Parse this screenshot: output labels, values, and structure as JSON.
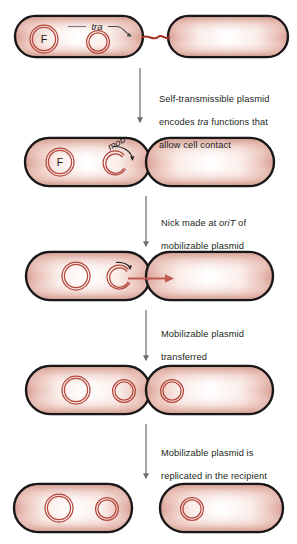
{
  "figure": {
    "colors": {
      "cell_outline": "#1a1618",
      "cell_fill_edge": "#e0a99e",
      "cell_fill_center": "#ffffff",
      "plasmid_stroke": "#b4463c",
      "bridge": "#a83228",
      "transfer_arrow": "#c05a50",
      "connector_arrow": "#6f6f6f",
      "label_leader": "#7a7a7a",
      "caption_text": "#231f20",
      "background": "#ffffff"
    }
  },
  "panels": [
    {
      "id": "panel-1",
      "name": "donor-and-recipient-in-contact",
      "labels": [
        {
          "id": "f-plasmid-label",
          "text": "F"
        },
        {
          "id": "tra-label",
          "text": "tra",
          "italic": true
        }
      ],
      "plasmids": [
        {
          "id": "f-plasmid",
          "label": "F",
          "state": "closed",
          "cell": "donor"
        },
        {
          "id": "mobilizable-plasmid",
          "label": "",
          "state": "closed",
          "cell": "donor"
        }
      ],
      "cells": [
        {
          "id": "donor-cell",
          "role": "donor"
        },
        {
          "id": "recipient-cell",
          "role": "recipient"
        }
      ],
      "bridge": {
        "id": "conjugation-bridge",
        "present": true
      }
    },
    {
      "id": "panel-2",
      "name": "cells-in-contact-mob-nicking",
      "labels": [
        {
          "id": "f-plasmid-label",
          "text": "F"
        },
        {
          "id": "mob-label",
          "text": "mob",
          "italic": true
        }
      ],
      "plasmids": [
        {
          "id": "f-plasmid",
          "label": "F",
          "state": "closed",
          "cell": "donor"
        },
        {
          "id": "mobilizable-plasmid",
          "label": "",
          "state": "nicked",
          "cell": "donor"
        }
      ],
      "cells": [
        {
          "id": "donor-cell",
          "role": "donor"
        },
        {
          "id": "recipient-cell",
          "role": "recipient"
        }
      ],
      "bridge": {
        "id": "conjugation-bridge",
        "present": false
      }
    },
    {
      "id": "panel-3",
      "name": "plasmid-transfer-in-progress",
      "labels": [],
      "plasmids": [
        {
          "id": "f-plasmid",
          "label": "",
          "state": "closed",
          "cell": "donor"
        },
        {
          "id": "mobilizable-plasmid",
          "label": "",
          "state": "nicked",
          "cell": "donor"
        }
      ],
      "cells": [
        {
          "id": "donor-cell",
          "role": "donor"
        },
        {
          "id": "recipient-cell",
          "role": "recipient"
        }
      ],
      "transfer_arrow": {
        "id": "dna-transfer-arrow",
        "direction": "right"
      }
    },
    {
      "id": "panel-4",
      "name": "plasmid-transferred-both-cells",
      "labels": [],
      "plasmids": [
        {
          "id": "f-plasmid",
          "label": "",
          "state": "closed",
          "cell": "donor"
        },
        {
          "id": "mobilizable-plasmid-donor",
          "label": "",
          "state": "closed",
          "cell": "donor"
        },
        {
          "id": "mobilizable-plasmid-recipient",
          "label": "",
          "state": "closed",
          "cell": "recipient"
        }
      ],
      "cells": [
        {
          "id": "donor-cell",
          "role": "donor"
        },
        {
          "id": "recipient-cell",
          "role": "recipient"
        }
      ]
    },
    {
      "id": "panel-5",
      "name": "separated-cells-final",
      "labels": [],
      "plasmids": [
        {
          "id": "f-plasmid",
          "label": "",
          "state": "closed",
          "cell": "donor"
        },
        {
          "id": "mobilizable-plasmid-donor",
          "label": "",
          "state": "closed",
          "cell": "donor"
        },
        {
          "id": "mobilizable-plasmid-recipient",
          "label": "",
          "state": "closed",
          "cell": "recipient"
        }
      ],
      "cells": [
        {
          "id": "donor-cell",
          "role": "donor"
        },
        {
          "id": "recipient-cell",
          "role": "recipient"
        }
      ]
    }
  ],
  "captions": [
    {
      "id": "caption-1",
      "name": "step-1-caption",
      "line1": "Self-transmissible plasmid",
      "line2_pre": "encodes ",
      "line2_em": "tra",
      "line2_post": " functions that",
      "line3": "allow cell contact"
    },
    {
      "id": "caption-2",
      "name": "step-2-caption",
      "line1_pre": "Nick made at ",
      "line1_em": "oriT",
      "line1_post": " of",
      "line2": "mobilizable plasmid"
    },
    {
      "id": "caption-3",
      "name": "step-3-caption",
      "line1": "Mobilizable plasmid",
      "line2": "transferred"
    },
    {
      "id": "caption-4",
      "name": "step-4-caption",
      "line1": "Mobilizable plasmid is",
      "line2": "replicated in the recipient"
    }
  ],
  "connectors": [
    {
      "id": "connector-1",
      "name": "step-arrow-1-to-2"
    },
    {
      "id": "connector-2",
      "name": "step-arrow-2-to-3"
    },
    {
      "id": "connector-3",
      "name": "step-arrow-3-to-4"
    },
    {
      "id": "connector-4",
      "name": "step-arrow-4-to-5"
    }
  ]
}
